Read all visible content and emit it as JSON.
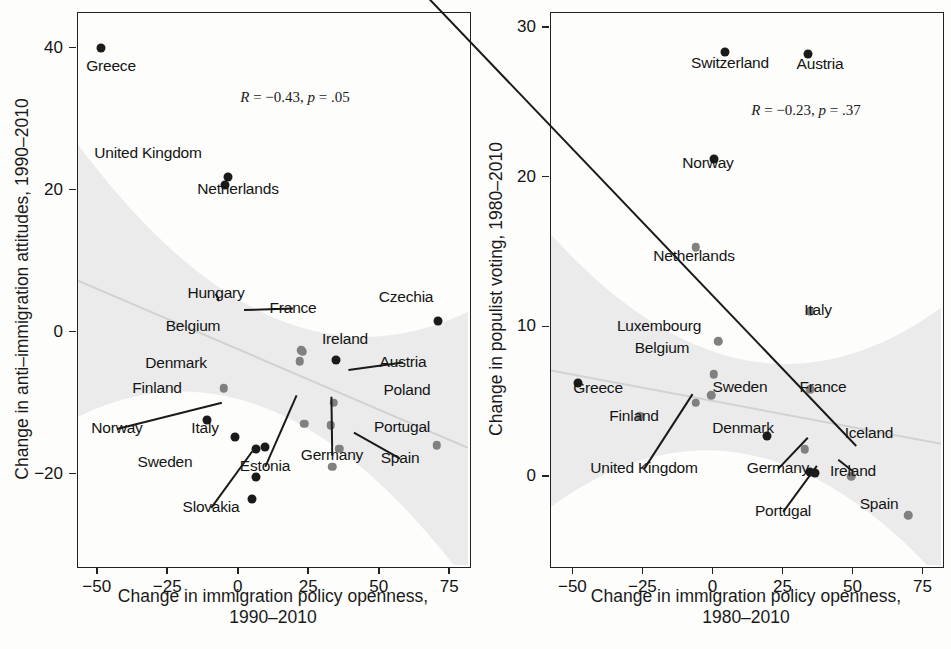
{
  "figure": {
    "title": "",
    "panels": [
      "left",
      "right"
    ]
  },
  "chart_data": [
    {
      "type": "scatter",
      "panel": "left",
      "title": "",
      "xlabel": "Change in immigration policy openness, 1990–2010",
      "ylabel": "Change in anti–immigration attitudes, 1990–2010",
      "annotation": "R = −0.43, p = .05",
      "R": -0.43,
      "p": 0.05,
      "xlim": [
        -57,
        82
      ],
      "ylim": [
        -33,
        45
      ],
      "xticks": [
        -50,
        -25,
        0,
        25,
        50,
        75
      ],
      "yticks": [
        40,
        20,
        0,
        -20
      ],
      "xtick_labels": [
        "−50",
        "−25",
        "0",
        "25",
        "50",
        "75"
      ],
      "ytick_labels": [
        "40",
        "20",
        "0",
        "−20"
      ],
      "grid": false,
      "legend": "none",
      "fit": {
        "slope": -0.17,
        "intercept": -2.5,
        "band": true
      },
      "points": [
        {
          "label": "Greece",
          "x": -48.5,
          "y": 40.0,
          "shade": "dark"
        },
        {
          "label": "United Kingdom",
          "x": -3.5,
          "y": 21.8,
          "shade": "dark"
        },
        {
          "label": "Netherlands",
          "x": -4.5,
          "y": 20.7,
          "shade": "dark"
        },
        {
          "label": "Czechia",
          "x": 71.0,
          "y": 1.5,
          "shade": "dark"
        },
        {
          "label": "Hungary",
          "x": 22.5,
          "y": -2.6,
          "shade": "gray"
        },
        {
          "label": "France",
          "x": 23.0,
          "y": -2.8,
          "shade": "gray"
        },
        {
          "label": "Belgium",
          "x": 22.0,
          "y": -4.2,
          "shade": "gray"
        },
        {
          "label": "Ireland",
          "x": 35.0,
          "y": -4.0,
          "shade": "dark"
        },
        {
          "label": "Denmark",
          "x": -5.0,
          "y": -8.0,
          "shade": "gray"
        },
        {
          "label": "Austria",
          "x": 34.0,
          "y": -10.0,
          "shade": "gray"
        },
        {
          "label": "Finland",
          "x": -11.0,
          "y": -12.5,
          "shade": "dark"
        },
        {
          "label": "Estonia",
          "x": 23.5,
          "y": -13.0,
          "shade": "gray"
        },
        {
          "label": "Germany",
          "x": 33.0,
          "y": -13.2,
          "shade": "gray"
        },
        {
          "label": "Norway",
          "x": -1.0,
          "y": -14.8,
          "shade": "dark"
        },
        {
          "label": "Italy",
          "x": 6.5,
          "y": -16.5,
          "shade": "dark"
        },
        {
          "label": "Italy2",
          "x": 9.5,
          "y": -16.3,
          "shade": "dark"
        },
        {
          "label": "Poland",
          "x": 36.0,
          "y": -16.5,
          "shade": "gray"
        },
        {
          "label": "Portugal",
          "x": 70.5,
          "y": -16.0,
          "shade": "gray"
        },
        {
          "label": "Sweden",
          "x": 6.5,
          "y": -20.5,
          "shade": "dark"
        },
        {
          "label": "Spain",
          "x": 33.5,
          "y": -19.0,
          "shade": "gray"
        },
        {
          "label": "Slovakia",
          "x": 5.0,
          "y": -23.5,
          "shade": "dark"
        }
      ]
    },
    {
      "type": "scatter",
      "panel": "right",
      "title": "",
      "xlabel": "Change in immigration policy openness, 1980–2010",
      "ylabel": "Change in populist voting, 1980–2010",
      "annotation": "R = −0.23, p = .37",
      "R": -0.23,
      "p": 0.37,
      "xlim": [
        -58,
        82
      ],
      "ylim": [
        -6,
        31
      ],
      "xticks": [
        -50,
        -25,
        0,
        25,
        50,
        75
      ],
      "yticks": [
        30,
        20,
        10,
        0
      ],
      "xtick_labels": [
        "−50",
        "−25",
        "0",
        "25",
        "50",
        "75"
      ],
      "ytick_labels": [
        "30",
        "20",
        "10",
        "0"
      ],
      "grid": false,
      "legend": "none",
      "fit": {
        "slope": -0.035,
        "intercept": 5.0,
        "band": true
      },
      "points": [
        {
          "label": "Switzerland",
          "x": 4.5,
          "y": 28.3,
          "shade": "dark"
        },
        {
          "label": "Austria",
          "x": 34.0,
          "y": 28.2,
          "shade": "dark"
        },
        {
          "label": "Norway",
          "x": 0.5,
          "y": 21.2,
          "shade": "dark"
        },
        {
          "label": "Netherlands",
          "x": -6.0,
          "y": 15.3,
          "shade": "gray"
        },
        {
          "label": "Italy",
          "x": 35.0,
          "y": 11.0,
          "shade": "gray"
        },
        {
          "label": "Luxembourg",
          "x": 2.0,
          "y": 9.0,
          "shade": "gray"
        },
        {
          "label": "Belgium",
          "x": 0.5,
          "y": 6.8,
          "shade": "gray"
        },
        {
          "label": "Greece",
          "x": -48.0,
          "y": 6.2,
          "shade": "dark"
        },
        {
          "label": "France",
          "x": 35.0,
          "y": 5.8,
          "shade": "gray"
        },
        {
          "label": "Sweden",
          "x": -0.5,
          "y": 5.4,
          "shade": "gray"
        },
        {
          "label": "United Kingdom",
          "x": -6.0,
          "y": 4.9,
          "shade": "gray"
        },
        {
          "label": "Finland",
          "x": -26.0,
          "y": 4.0,
          "shade": "gray"
        },
        {
          "label": "Denmark",
          "x": 19.5,
          "y": 2.7,
          "shade": "dark"
        },
        {
          "label": "Germany",
          "x": 33.0,
          "y": 1.8,
          "shade": "gray"
        },
        {
          "label": "Portugal",
          "x": 35.0,
          "y": 0.3,
          "shade": "dark"
        },
        {
          "label": "Ireland",
          "x": 36.5,
          "y": 0.2,
          "shade": "dark"
        },
        {
          "label": "Iceland",
          "x": 49.5,
          "y": 0.0,
          "shade": "gray"
        },
        {
          "label": "Spain",
          "x": 70.0,
          "y": -2.6,
          "shade": "gray"
        }
      ]
    }
  ],
  "left_panel": {
    "ylabel": "Change in anti–immigration attitudes, 1990–2010",
    "xlabel_line1": "Change in immigration policy openness,",
    "xlabel_line2": "1990–2010",
    "stat_r": "R",
    "stat_eq1": " = −0.43, ",
    "stat_p": "p",
    "stat_eq2": " = .05",
    "ytick_labels": [
      "40",
      "20",
      "0",
      "−20"
    ],
    "xtick_labels": [
      "−50",
      "−25",
      "0",
      "25",
      "50",
      "75"
    ],
    "labels": [
      "Greece",
      "United Kingdom",
      "Netherlands",
      "Czechia",
      "Hungary",
      "France",
      "Belgium",
      "Ireland",
      "Denmark",
      "Austria",
      "Finland",
      "Estonia",
      "Germany",
      "Norway",
      "Italy",
      "Poland",
      "Portugal",
      "Sweden",
      "Spain",
      "Slovakia"
    ]
  },
  "right_panel": {
    "ylabel": "Change in populist voting, 1980–2010",
    "xlabel_line1": "Change in immigration policy openness,",
    "xlabel_line2": "1980–2010",
    "stat_r": "R",
    "stat_eq1": " = −0.23, ",
    "stat_p": "p",
    "stat_eq2": " = .37",
    "ytick_labels": [
      "30",
      "20",
      "10",
      "0"
    ],
    "xtick_labels": [
      "−50",
      "−25",
      "0",
      "25",
      "50",
      "75"
    ],
    "labels": [
      "Switzerland",
      "Austria",
      "Norway",
      "Netherlands",
      "Italy",
      "Luxembourg",
      "Belgium",
      "Greece",
      "France",
      "Sweden",
      "United Kingdom",
      "Finland",
      "Denmark",
      "Germany",
      "Portugal",
      "Ireland",
      "Iceland",
      "Spain"
    ]
  },
  "style": {
    "dark_point": "#1a1a1a",
    "gray_point": "#808080",
    "band_color": "#e8e8e8",
    "axis_color": "#222222"
  }
}
